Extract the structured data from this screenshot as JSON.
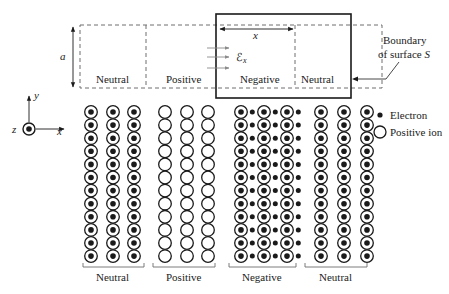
{
  "top_diagram": {
    "height_label": "a",
    "length_label": "x",
    "field_label": "ℰ",
    "field_subscript": "x",
    "regions": [
      {
        "label": "Neutral"
      },
      {
        "label": "Positive"
      },
      {
        "label": "Negative"
      },
      {
        "label": "Neutral"
      }
    ],
    "boundary_label_line1": "Boundary",
    "boundary_label_line2": "of surface ",
    "boundary_label_symbol": "S"
  },
  "axes": {
    "y_label": "y",
    "x_label": "x",
    "z_label": "z"
  },
  "legend": {
    "electron_label": "Electron",
    "ion_label": "Positive ion"
  },
  "lattice": {
    "rows": 12,
    "groups": [
      {
        "label": "Neutral",
        "type": "neutral",
        "columns": 3
      },
      {
        "label": "Positive",
        "type": "positive",
        "columns": 3
      },
      {
        "label": "Negative",
        "type": "negative",
        "columns": 3
      },
      {
        "label": "Neutral",
        "type": "neutral",
        "columns": 3
      }
    ]
  },
  "colors": {
    "ink": "#1a1a1a",
    "dashed": "#6e6e6e",
    "arrow_gray": "#8a8a8a"
  }
}
